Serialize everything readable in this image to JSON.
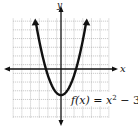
{
  "chart_data": {
    "type": "line",
    "title": "",
    "function_label": "f(x) = x² − 3",
    "xlabel": "x",
    "ylabel": "y",
    "xlim": [
      -5,
      5
    ],
    "ylim": [
      -5,
      6
    ],
    "grid": true,
    "series": [
      {
        "name": "f(x) = x^2 - 3",
        "x": [
          -3,
          -2.5,
          -2,
          -1.5,
          -1,
          -0.5,
          0,
          0.5,
          1,
          1.5,
          2,
          2.5,
          3
        ],
        "values": [
          6,
          3.25,
          1,
          -0.75,
          -2,
          -2.75,
          -3,
          -2.75,
          -2,
          -0.75,
          1,
          3.25,
          6
        ]
      }
    ],
    "vertex": [
      0,
      -3
    ]
  },
  "labels": {
    "x_axis": "x",
    "y_axis": "y",
    "function_prefix": "f(x) = x",
    "function_exp": "2",
    "function_suffix": " − 3"
  }
}
